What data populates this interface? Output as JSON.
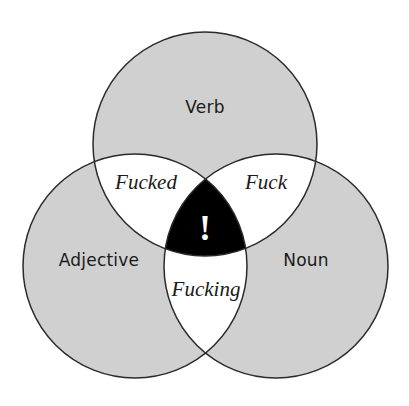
{
  "diagram": {
    "type": "venn-3",
    "colors": {
      "background": "#ffffff",
      "set_fill": "#d0d0d0",
      "pair_overlap_fill": "#ffffff",
      "triple_overlap_fill": "#000000",
      "outline": "#2a2a2a",
      "text": "#1a1a1a",
      "center_text": "#ffffff"
    },
    "sets": [
      {
        "id": "verb",
        "label": "Verb",
        "cx": 205,
        "cy": 144,
        "r": 112
      },
      {
        "id": "adjective",
        "label": "Adjective",
        "cx": 135,
        "cy": 266,
        "r": 112
      },
      {
        "id": "noun",
        "label": "Noun",
        "cx": 276,
        "cy": 266,
        "r": 112
      }
    ],
    "overlaps": {
      "verb_adjective": "Fucked",
      "verb_noun": "Fuck",
      "adjective_noun": "Fucking",
      "all_three": "!"
    }
  }
}
